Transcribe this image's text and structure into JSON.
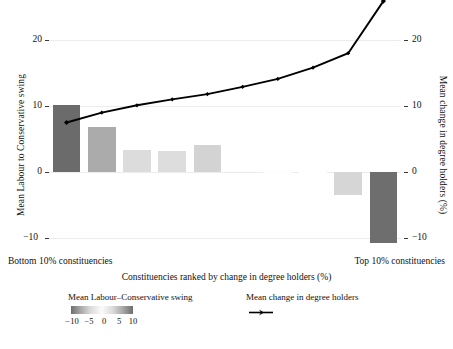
{
  "chart_data": {
    "type": "bar",
    "title": "",
    "xlabel": "Constituencies ranked by change in degree holders (%)",
    "ylabel_left": "Mean Labour to Conservative swing",
    "ylabel_right": "Mean change in degree holders (%)",
    "x_category_left": "Bottom 10% constituencies",
    "x_category_right": "Top 10% constituencies",
    "ylim": [
      -13.5,
      26.5
    ],
    "y_ticks": [
      20,
      10,
      0,
      -10
    ],
    "y_ticks_right": [
      20,
      10,
      0,
      -10
    ],
    "grid": true,
    "legend_position": "bottom",
    "categories": [
      1,
      2,
      3,
      4,
      5,
      6,
      7,
      8,
      9,
      10
    ],
    "series": [
      {
        "name": "Mean Labour-Conservative swing",
        "type": "bar",
        "axis": "left",
        "values": [
          10.2,
          6.8,
          3.4,
          3.2,
          4.1,
          0.15,
          0.05,
          0.0,
          -3.5,
          -10.8
        ]
      },
      {
        "name": "Mean change in degree holders",
        "type": "line",
        "axis": "right",
        "values": [
          7.5,
          9.0,
          10.1,
          11.0,
          11.8,
          12.9,
          14.1,
          15.8,
          18.0,
          25.9
        ]
      }
    ],
    "colorbar": {
      "title": "Mean Labour–Conservative swing",
      "ticks": [
        "−10",
        "−5",
        "0",
        "5",
        "10"
      ],
      "low_color": "#6f6f6f",
      "mid_color": "#fbfbfb",
      "high_color": "#6d6d6d"
    },
    "bar_colors": [
      "#6b6b6b",
      "#ababab",
      "#dcdcdc",
      "#dddddd",
      "#d3d3d3",
      "#fafafa",
      "#fcfcfc",
      "#fdfdfd",
      "#d6d6d6",
      "#6e6e6e"
    ],
    "line_color": "#000000"
  },
  "axes": {
    "left_title": "Mean Labour to Conservative swing",
    "right_title": "Mean change in degree holders (%)",
    "x_title": "Constituencies ranked by change in degree holders (%)",
    "left_ticks": [
      "20",
      "10",
      "0",
      "−10"
    ],
    "right_ticks": [
      "20",
      "10",
      "0",
      "−10"
    ],
    "x_left_label": "Bottom 10% constituencies",
    "x_right_label": "Top 10% constituencies"
  },
  "legend": {
    "bar_title": "Mean Labour–Conservative swing",
    "line_title": "Mean change in degree holders",
    "gradient_ticks": [
      "−10",
      "−5",
      "0",
      "5",
      "10"
    ]
  }
}
